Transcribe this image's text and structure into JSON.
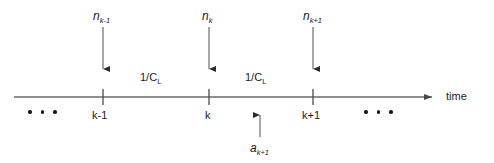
{
  "figure": {
    "type": "timeline-diagram",
    "background_color": "#ffffff",
    "line_color": "#5a5a5a",
    "text_color": "#1a1a1a",
    "axis": {
      "label": "time",
      "arrowhead": "right-arrow"
    },
    "arrivals": [
      {
        "symbol": "n",
        "sub": "k-1",
        "x": 103,
        "direction": "down"
      },
      {
        "symbol": "n",
        "sub": "k",
        "x": 209,
        "direction": "down"
      },
      {
        "symbol": "n",
        "sub": "k+1",
        "x": 313,
        "direction": "down"
      }
    ],
    "ticks": [
      {
        "label": "k-1",
        "x": 103
      },
      {
        "label": "k",
        "x": 209
      },
      {
        "label": "k+1",
        "x": 313
      }
    ],
    "intervals": [
      {
        "label": "1/C",
        "sub": "L",
        "x": 150
      },
      {
        "label": "1/C",
        "sub": "L",
        "x": 255
      }
    ],
    "departure": {
      "symbol": "a",
      "sub": "k+1",
      "x": 260,
      "direction": "up"
    },
    "ellipses": [
      {
        "position": "left",
        "count": 3
      },
      {
        "position": "right",
        "count": 3
      }
    ]
  }
}
